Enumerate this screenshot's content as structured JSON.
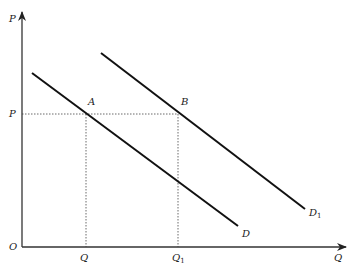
{
  "diagram": {
    "type": "economics-demand-shift",
    "axes": {
      "y_label": "P",
      "x_label": "Q",
      "origin_label": "O"
    },
    "price_level_label": "P",
    "quantity_labels": [
      {
        "text": "Q",
        "sub": ""
      },
      {
        "text": "Q",
        "sub": "1"
      }
    ],
    "points": [
      {
        "label": "A",
        "x": 86,
        "y": 114
      },
      {
        "label": "B",
        "x": 178,
        "y": 114
      }
    ],
    "curves": [
      {
        "label": "D",
        "sub": "",
        "x1": 32,
        "y1": 73,
        "x2": 238,
        "y2": 226
      },
      {
        "label": "D",
        "sub": "1",
        "x1": 101,
        "y1": 53,
        "x2": 305,
        "y2": 209
      }
    ],
    "colors": {
      "line": "#111111",
      "axis": "#333333",
      "guide": "#444444"
    }
  }
}
